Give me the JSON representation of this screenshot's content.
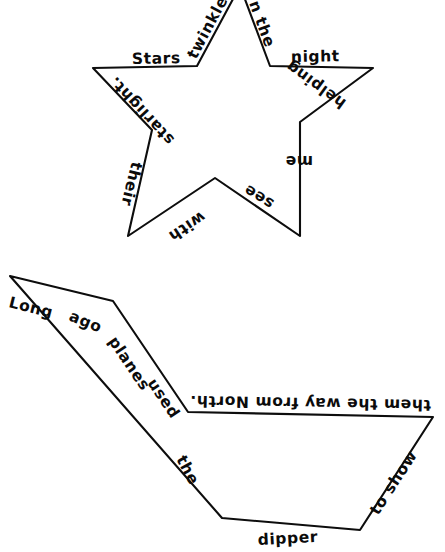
{
  "page": {
    "background_color": "#ffffff",
    "ink_color": "#0d0d0d"
  },
  "shapes": [
    {
      "name": "five-pointed-star",
      "type": "outline",
      "poem_text": "Stars twinkle in the night helping me see with their starlight.",
      "segments": [
        {
          "id": "star-seg-1",
          "label": "Stars",
          "edge": "upper-left-horizontal",
          "orientation": "upright"
        },
        {
          "id": "star-seg-2",
          "label": "twinkle",
          "edge": "left-inner-rising",
          "orientation": "rotated"
        },
        {
          "id": "star-seg-3",
          "label": "n the",
          "edge": "right-inner-falling",
          "orientation": "rotated"
        },
        {
          "id": "star-seg-4",
          "label": "night",
          "edge": "upper-right-horizontal",
          "orientation": "upright"
        },
        {
          "id": "star-seg-5",
          "label": "helping",
          "edge": "right-outer-descending",
          "orientation": "upside-down"
        },
        {
          "id": "star-seg-6",
          "label": "me",
          "edge": "right-inner-descending",
          "orientation": "upside-down"
        },
        {
          "id": "star-seg-7",
          "label": "see",
          "edge": "lower-right-rising",
          "orientation": "upside-down"
        },
        {
          "id": "star-seg-8",
          "label": "with",
          "edge": "lower-left-rising",
          "orientation": "upside-down"
        },
        {
          "id": "star-seg-9",
          "label": "their",
          "edge": "left-inner-descending",
          "orientation": "rotated"
        },
        {
          "id": "star-seg-10",
          "label": "starlight.",
          "edge": "left-outer-descending",
          "orientation": "upside-down"
        }
      ]
    },
    {
      "name": "big-dipper",
      "type": "outline",
      "poem_text": "Long ago planes used the dipper to show them the way from North.",
      "segments": [
        {
          "id": "dipper-seg-1",
          "label": "Long",
          "edge": "handle-top-left",
          "orientation": "upright"
        },
        {
          "id": "dipper-seg-2",
          "label": "ago",
          "edge": "handle-upper",
          "orientation": "rotated"
        },
        {
          "id": "dipper-seg-3",
          "label": "planes",
          "edge": "handle-middle",
          "orientation": "rotated"
        },
        {
          "id": "dipper-seg-4",
          "label": "used",
          "edge": "handle-lower",
          "orientation": "rotated"
        },
        {
          "id": "dipper-seg-5",
          "label": "the",
          "edge": "bowl-left-side",
          "orientation": "rotated"
        },
        {
          "id": "dipper-seg-6",
          "label": "dipper",
          "edge": "bowl-bottom",
          "orientation": "upright"
        },
        {
          "id": "dipper-seg-7",
          "label": "to show",
          "edge": "bowl-right-side",
          "orientation": "rotated"
        },
        {
          "id": "dipper-seg-8",
          "label": "them the way from North.",
          "edge": "bowl-rim",
          "orientation": "upside-down"
        }
      ]
    }
  ]
}
